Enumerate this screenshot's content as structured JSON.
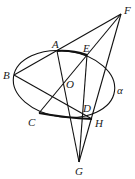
{
  "diagram": {
    "type": "geometry-figure",
    "plane_label": "α",
    "colors": {
      "stroke": "#111111",
      "background": "#ffffff",
      "text": "#1a1a1a"
    },
    "ellipse": {
      "cx": 64,
      "cy": 84,
      "rx": 51,
      "ry": 33,
      "rotate": 8
    },
    "points": [
      {
        "name": "A",
        "x": 57,
        "y": 51,
        "label_x": 52,
        "label_y": 48
      },
      {
        "name": "B",
        "x": 14,
        "y": 75,
        "label_x": 3,
        "label_y": 79
      },
      {
        "name": "C",
        "x": 39,
        "y": 113,
        "label_x": 28,
        "label_y": 126
      },
      {
        "name": "D",
        "x": 83,
        "y": 116,
        "label_x": 83,
        "label_y": 112
      },
      {
        "name": "E",
        "x": 87,
        "y": 55,
        "label_x": 83,
        "label_y": 52
      },
      {
        "name": "F",
        "x": 121,
        "y": 14,
        "label_x": 124,
        "label_y": 14
      },
      {
        "name": "G",
        "x": 79,
        "y": 162,
        "label_x": 75,
        "label_y": 175
      },
      {
        "name": "H",
        "x": 92,
        "y": 119,
        "label_x": 95,
        "label_y": 127
      },
      {
        "name": "O",
        "x": 64,
        "y": 88,
        "label_x": 66,
        "label_y": 88
      }
    ],
    "labels": {
      "A": "A",
      "B": "B",
      "C": "C",
      "D": "D",
      "E": "E",
      "F": "F",
      "G": "G",
      "H": "H",
      "O": "O",
      "alpha": "α"
    },
    "segments": [
      [
        "F",
        "B"
      ],
      [
        "F",
        "C"
      ],
      [
        "F",
        "G"
      ],
      [
        "A",
        "G"
      ],
      [
        "E",
        "G"
      ],
      [
        "B",
        "H"
      ],
      [
        "C",
        "H"
      ],
      [
        "A",
        "E"
      ]
    ]
  }
}
